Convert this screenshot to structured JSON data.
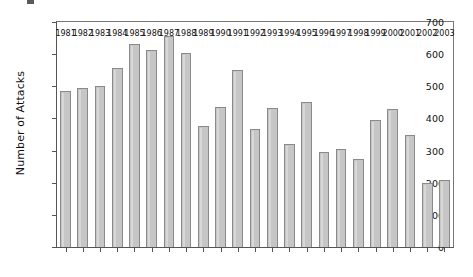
{
  "figure": {
    "ylabel": "Number of Attacks",
    "corner_mark": "figure-label-mark"
  },
  "chart_data": {
    "type": "bar",
    "title": "",
    "xlabel": "",
    "ylabel": "Number of Attacks",
    "categories": [
      "1981",
      "1982",
      "1983",
      "1984",
      "1985",
      "1986",
      "1987",
      "1988",
      "1989",
      "1990",
      "1991",
      "1992",
      "1993",
      "1994",
      "1995",
      "1996",
      "1997",
      "1998",
      "1999",
      "2000",
      "2001",
      "2002",
      "2003"
    ],
    "values": [
      485,
      495,
      500,
      558,
      633,
      612,
      657,
      605,
      375,
      437,
      550,
      367,
      434,
      322,
      452,
      296,
      304,
      274,
      395,
      430,
      348,
      200,
      208
    ],
    "ylim": [
      0,
      700
    ],
    "yticks": [
      0,
      100,
      200,
      300,
      400,
      500,
      600,
      700
    ],
    "ytick_labels": [
      "0",
      "100",
      "200",
      "300",
      "400",
      "500",
      "600",
      "700"
    ],
    "grid": false,
    "legend": null,
    "bar_color": "#c6c6c6",
    "bar_edge_color": "#8a8a8a",
    "axis_color": "#555555"
  }
}
